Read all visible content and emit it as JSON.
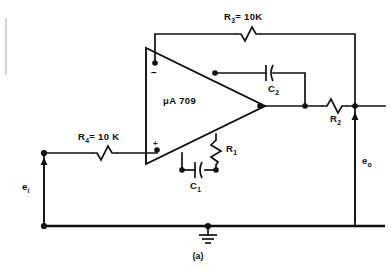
{
  "figure": {
    "caption": "(a)",
    "device_label": "μA 709"
  },
  "components": {
    "r3": {
      "name": "R",
      "sub": "3",
      "value": "=  10K",
      "full": "R3 = 10K"
    },
    "r4": {
      "name": "R",
      "sub": "4",
      "value": "=  10 K",
      "full": "R4 = 10 K"
    },
    "r2": {
      "name": "R",
      "sub": "2",
      "value": "",
      "full": "R2"
    },
    "r1": {
      "name": "R",
      "sub": "1",
      "value": "",
      "full": "R1"
    },
    "c1": {
      "name": "C",
      "sub": "1",
      "value": "",
      "full": "C1"
    },
    "c2": {
      "name": "C",
      "sub": "2",
      "value": "",
      "full": "C2"
    }
  },
  "signals": {
    "input": {
      "name": "e",
      "sub": "i",
      "full": "ei"
    },
    "output": {
      "name": "e",
      "sub": "o",
      "full": "eo"
    }
  },
  "opamp": {
    "inverting_sign": "−",
    "noninverting_sign": "+"
  },
  "colors": {
    "ink": "#111111",
    "background": "#fefefe"
  }
}
